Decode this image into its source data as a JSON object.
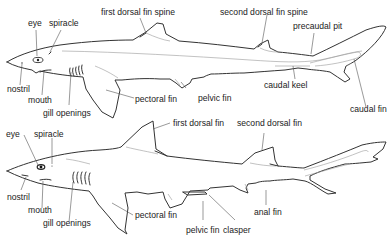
{
  "diagram": {
    "top_shark": {
      "labels": {
        "eye": "eye",
        "spiracle": "spiracle",
        "first_dorsal_fin_spine": "first dorsal fin spine",
        "second_dorsal_fin_spine": "second dorsal fin spine",
        "precaudal_pit": "precaudal pit",
        "nostril": "nostril",
        "mouth": "mouth",
        "gill_openings": "gill openings",
        "pectoral_fin": "pectoral fin",
        "pelvic_fin": "pelvic fin",
        "caudal_keel": "caudal keel",
        "caudal_fin": "caudal fin"
      }
    },
    "bottom_shark": {
      "labels": {
        "eye": "eye",
        "spiracle": "spiracle",
        "first_dorsal_fin": "first dorsal fin",
        "second_dorsal_fin": "second dorsal fin",
        "nostril": "nostril",
        "mouth": "mouth",
        "gill_openings": "gill openings",
        "pectoral_fin": "pectoral fin",
        "pelvic_fin": "pelvic fin",
        "clasper": "clasper",
        "anal_fin": "anal fin"
      }
    },
    "colors": {
      "outline": "#333333",
      "text": "#222222",
      "background": "#ffffff"
    }
  }
}
